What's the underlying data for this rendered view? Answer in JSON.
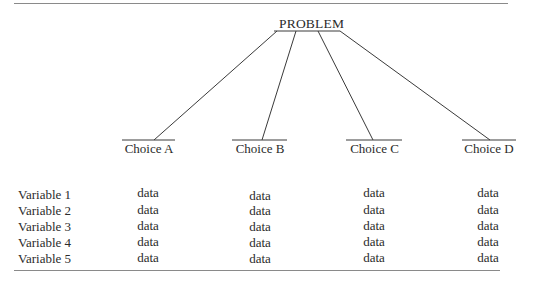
{
  "root": {
    "label": "PROBLEM"
  },
  "choices": [
    {
      "label": "Choice A"
    },
    {
      "label": "Choice B"
    },
    {
      "label": "Choice C"
    },
    {
      "label": "Choice D"
    }
  ],
  "table": {
    "rows": [
      {
        "label": "Variable  1",
        "cells": [
          "data",
          "data",
          "data",
          "data"
        ]
      },
      {
        "label": "Variable  2",
        "cells": [
          "data",
          "data",
          "data",
          "data"
        ]
      },
      {
        "label": "Variable  3",
        "cells": [
          "data",
          "data",
          "data",
          "data"
        ]
      },
      {
        "label": "Variable  4",
        "cells": [
          "data",
          "data",
          "data",
          "data"
        ]
      },
      {
        "label": "Variable  5",
        "cells": [
          "data",
          "data",
          "data",
          "data"
        ]
      }
    ]
  }
}
